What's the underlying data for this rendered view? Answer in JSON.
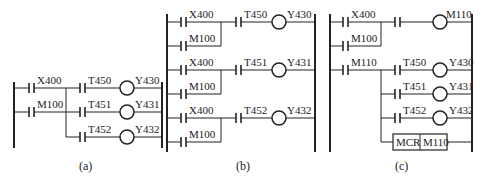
{
  "figure": {
    "panels": [
      {
        "id": "a",
        "caption": "(a)",
        "inputs": [
          "X400",
          "M100"
        ],
        "outputs": [
          {
            "contact": "T450",
            "coil": "Y430"
          },
          {
            "contact": "T451",
            "coil": "Y431"
          },
          {
            "contact": "T452",
            "coil": "Y432"
          }
        ]
      },
      {
        "id": "b",
        "caption": "(b)",
        "rungs": [
          {
            "inputs": [
              "X400",
              "M100"
            ],
            "contact": "T450",
            "coil": "Y430"
          },
          {
            "inputs": [
              "X400",
              "M100"
            ],
            "contact": "T451",
            "coil": "Y431"
          },
          {
            "inputs": [
              "X400",
              "M100"
            ],
            "contact": "T452",
            "coil": "Y432"
          }
        ]
      },
      {
        "id": "c",
        "caption": "(c)",
        "set_rung": {
          "inputs": [
            "X400",
            "M100"
          ],
          "coil": "M110"
        },
        "master_contact": "M110",
        "outputs": [
          {
            "contact": "T450",
            "coil": "Y430"
          },
          {
            "contact": "T451",
            "coil": "Y431"
          },
          {
            "contact": "T452",
            "coil": "Y432"
          }
        ],
        "mcr_box": {
          "instr": "MCR",
          "operand": "M110"
        }
      }
    ]
  }
}
